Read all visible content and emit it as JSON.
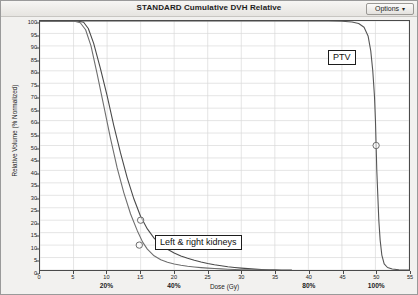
{
  "window": {
    "title": "STANDARD Cumulative DVH Relative",
    "options_button": {
      "label": "Options",
      "caret": "▾",
      "icon": "chevron-down-icon"
    }
  },
  "chart_data": {
    "type": "line",
    "title": "STANDARD Cumulative DVH Relative",
    "xlabel": "Dose (Gy)",
    "ylabel": "Relative Volume (% Normalized)",
    "xlim": [
      0,
      55
    ],
    "ylim": [
      0,
      100
    ],
    "xticks": [
      0,
      5,
      10,
      15,
      20,
      25,
      30,
      35,
      40,
      45,
      50,
      55
    ],
    "yticks": [
      0,
      5,
      10,
      15,
      20,
      25,
      30,
      35,
      40,
      45,
      50,
      55,
      60,
      65,
      70,
      75,
      80,
      85,
      90,
      95,
      100
    ],
    "grid": true,
    "legend_position": "none",
    "secondary_x_annotations": [
      {
        "label": "20%",
        "x": 10
      },
      {
        "label": "40%",
        "x": 20
      },
      {
        "label": "80%",
        "x": 40
      },
      {
        "label": "100%",
        "x": 50
      }
    ],
    "annotations": [
      {
        "text": "PTV",
        "x": 44.5,
        "y": 88
      },
      {
        "text": "Left & right kidneys",
        "x": 24,
        "y": 17
      }
    ],
    "series": [
      {
        "name": "PTV",
        "color": "#555555",
        "points": [
          [
            0,
            100
          ],
          [
            5,
            100
          ],
          [
            10,
            100
          ],
          [
            15,
            100
          ],
          [
            20,
            100
          ],
          [
            25,
            100
          ],
          [
            30,
            100
          ],
          [
            35,
            100
          ],
          [
            40,
            100
          ],
          [
            43,
            100
          ],
          [
            45,
            99.9
          ],
          [
            46.5,
            99.6
          ],
          [
            47.5,
            99.0
          ],
          [
            48.3,
            97.5
          ],
          [
            48.9,
            94.0
          ],
          [
            49.3,
            88.0
          ],
          [
            49.6,
            80.0
          ],
          [
            49.85,
            70.0
          ],
          [
            50.0,
            60.0
          ],
          [
            50.1,
            50.0
          ],
          [
            50.2,
            40.0
          ],
          [
            50.35,
            30.0
          ],
          [
            50.5,
            20.0
          ],
          [
            50.7,
            12.0
          ],
          [
            50.95,
            6.0
          ],
          [
            51.3,
            2.5
          ],
          [
            51.8,
            1.0
          ],
          [
            52.5,
            0.4
          ],
          [
            53.5,
            0.1
          ],
          [
            55,
            0
          ]
        ],
        "markers": [
          {
            "x": 50.1,
            "y": 50,
            "shape": "circle"
          }
        ]
      },
      {
        "name": "Left kidney",
        "color": "#4a4a4a",
        "points": [
          [
            0,
            100
          ],
          [
            3,
            100
          ],
          [
            5.5,
            100
          ],
          [
            6.5,
            99.5
          ],
          [
            7.2,
            97
          ],
          [
            8,
            91
          ],
          [
            9,
            81
          ],
          [
            10,
            70
          ],
          [
            11,
            58
          ],
          [
            12,
            47
          ],
          [
            13,
            37
          ],
          [
            14,
            28.5
          ],
          [
            15,
            21.5
          ],
          [
            16,
            16.5
          ],
          [
            17,
            12.8
          ],
          [
            18,
            10.2
          ],
          [
            19,
            8.3
          ],
          [
            20,
            6.8
          ],
          [
            21,
            5.6
          ],
          [
            22,
            4.7
          ],
          [
            23,
            3.9
          ],
          [
            24,
            3.2
          ],
          [
            25,
            2.6
          ],
          [
            26,
            2.1
          ],
          [
            27,
            1.7
          ],
          [
            28,
            1.3
          ],
          [
            29,
            1.0
          ],
          [
            30,
            0.75
          ],
          [
            31,
            0.55
          ],
          [
            32,
            0.35
          ],
          [
            33,
            0.2
          ],
          [
            34,
            0.1
          ],
          [
            35,
            0.04
          ],
          [
            36,
            0.01
          ],
          [
            37.5,
            0
          ]
        ],
        "markers": [
          {
            "x": 15,
            "y": 20,
            "shape": "circle"
          }
        ]
      },
      {
        "name": "Right kidney",
        "color": "#6e6e6e",
        "points": [
          [
            0,
            100
          ],
          [
            3,
            100
          ],
          [
            5,
            100
          ],
          [
            6,
            99.3
          ],
          [
            6.8,
            96.5
          ],
          [
            7.6,
            90
          ],
          [
            8.5,
            79
          ],
          [
            9.5,
            66
          ],
          [
            10.5,
            53
          ],
          [
            11.5,
            41
          ],
          [
            12.5,
            31
          ],
          [
            13.5,
            22.5
          ],
          [
            14.5,
            15.8
          ],
          [
            15.3,
            11.2
          ],
          [
            16,
            8.4
          ],
          [
            17,
            5.7
          ],
          [
            18,
            4.1
          ],
          [
            19,
            3.1
          ],
          [
            20,
            2.4
          ],
          [
            21,
            1.9
          ],
          [
            22,
            1.5
          ],
          [
            23,
            1.2
          ],
          [
            24,
            0.95
          ],
          [
            25,
            0.75
          ],
          [
            26,
            0.58
          ],
          [
            27,
            0.44
          ],
          [
            28,
            0.32
          ],
          [
            29,
            0.22
          ],
          [
            30,
            0.13
          ],
          [
            31,
            0.07
          ],
          [
            32,
            0.03
          ],
          [
            33,
            0.01
          ],
          [
            34,
            0
          ]
        ],
        "markers": [
          {
            "x": 14.8,
            "y": 10,
            "shape": "circle"
          }
        ]
      }
    ]
  }
}
